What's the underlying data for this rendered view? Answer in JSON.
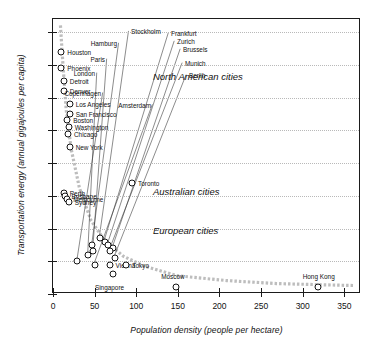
{
  "chart_data": {
    "type": "scatter",
    "title": "",
    "xlabel": "Population density (people per hectare)",
    "ylabel": "Transportation energy (annual gigajoules per capita)",
    "xlim": [
      0,
      370
    ],
    "ylim": [
      0,
      84
    ],
    "xticks": [
      0,
      50,
      100,
      150,
      200,
      250,
      300,
      350
    ],
    "yticks": [
      0,
      10,
      20,
      30,
      40,
      50,
      60,
      70,
      80
    ],
    "grid": "horizontal-dotted",
    "legend": "none",
    "annotations": [
      {
        "text": "North American cities",
        "x": 120,
        "y": 66
      },
      {
        "text": "Australian cities",
        "x": 120,
        "y": 31
      },
      {
        "text": "European cities",
        "x": 120,
        "y": 19
      }
    ],
    "points": [
      {
        "label": "Houston",
        "x": 10,
        "y": 74,
        "label_side": "right"
      },
      {
        "label": "Phoenix",
        "x": 10,
        "y": 69,
        "label_side": "right"
      },
      {
        "label": "Detroit",
        "x": 13,
        "y": 65,
        "label_side": "right"
      },
      {
        "label": "Denver",
        "x": 13,
        "y": 62,
        "label_side": "right"
      },
      {
        "label": "Los Angeles",
        "x": 20,
        "y": 58,
        "label_side": "right"
      },
      {
        "label": "San Francisco",
        "x": 20,
        "y": 55,
        "label_side": "right"
      },
      {
        "label": "Boston",
        "x": 17,
        "y": 53,
        "label_side": "right"
      },
      {
        "label": "Washington",
        "x": 19,
        "y": 51,
        "label_side": "right"
      },
      {
        "label": "Chicago",
        "x": 18,
        "y": 49,
        "label_side": "right"
      },
      {
        "label": "New York",
        "x": 20,
        "y": 45,
        "label_side": "right"
      },
      {
        "label": "Toronto",
        "x": 95,
        "y": 34,
        "label_side": "right"
      },
      {
        "label": "Perth",
        "x": 13,
        "y": 31,
        "label_side": "right"
      },
      {
        "label": "Brisbane",
        "x": 15,
        "y": 30,
        "label_side": "right"
      },
      {
        "label": "Melbourne",
        "x": 17,
        "y": 29,
        "label_side": "right"
      },
      {
        "label": "Sydney",
        "x": 19,
        "y": 28,
        "label_side": "right"
      },
      {
        "label": "Hamburg",
        "x": 47,
        "y": 15,
        "label_side": "leader"
      },
      {
        "label": "Stockholm",
        "x": 56,
        "y": 17,
        "label_side": "leader"
      },
      {
        "label": "Frankfurt",
        "x": 62,
        "y": 16,
        "label_side": "leader"
      },
      {
        "label": "Zurich",
        "x": 66,
        "y": 15,
        "label_side": "leader"
      },
      {
        "label": "Brussels",
        "x": 72,
        "y": 14,
        "label_side": "leader"
      },
      {
        "label": "Paris",
        "x": 48,
        "y": 13,
        "label_side": "leader"
      },
      {
        "label": "Munich",
        "x": 68,
        "y": 13,
        "label_side": "leader"
      },
      {
        "label": "London",
        "x": 42,
        "y": 12,
        "label_side": "leader"
      },
      {
        "label": "Berlin",
        "x": 74,
        "y": 11,
        "label_side": "leader"
      },
      {
        "label": "Copenhagen",
        "x": 29,
        "y": 10,
        "label_side": "leader"
      },
      {
        "label": "Amsterdam",
        "x": 50,
        "y": 9,
        "label_side": "leader"
      },
      {
        "label": "Vienna",
        "x": 68,
        "y": 9,
        "label_side": "right"
      },
      {
        "label": "Tokyo",
        "x": 88,
        "y": 9,
        "label_side": "right"
      },
      {
        "label": "Singapore",
        "x": 72,
        "y": 6,
        "label_side": "below"
      },
      {
        "label": "Moscow",
        "x": 148,
        "y": 2,
        "label_side": "above"
      },
      {
        "label": "Hong Kong",
        "x": 318,
        "y": 2,
        "label_side": "above"
      }
    ],
    "trend_curve": [
      [
        9,
        82
      ],
      [
        12,
        70
      ],
      [
        16,
        56
      ],
      [
        22,
        44
      ],
      [
        32,
        32
      ],
      [
        46,
        22
      ],
      [
        62,
        16
      ],
      [
        85,
        11
      ],
      [
        110,
        8
      ],
      [
        150,
        5
      ],
      [
        210,
        3.5
      ],
      [
        270,
        2.6
      ],
      [
        330,
        2.2
      ],
      [
        365,
        2.0
      ]
    ]
  }
}
